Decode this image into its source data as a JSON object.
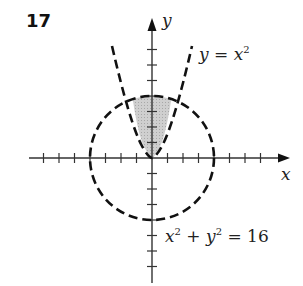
{
  "problem": {
    "number": "17"
  },
  "axes": {
    "x_label": "x",
    "y_label": "y",
    "x_ticks": [
      -7,
      -6,
      -5,
      -4,
      -3,
      -2,
      -1,
      1,
      2,
      3,
      4,
      5,
      6,
      7
    ],
    "y_ticks": [
      -7,
      -6,
      -5,
      -4,
      -3,
      -2,
      -1,
      1,
      2,
      3,
      4,
      5,
      6,
      7
    ]
  },
  "curves": {
    "parabola": {
      "lhs": "y",
      "eq": " = ",
      "base": "x",
      "exp": "2",
      "style": "dashed"
    },
    "circle": {
      "a": "x",
      "a_exp": "2",
      "plus": " + ",
      "b": "y",
      "b_exp": "2",
      "eq": " = ",
      "rhs": "16",
      "radius": 4,
      "style": "dashed"
    }
  },
  "shaded_region": {
    "description": "region above y = x^2 and inside x^2 + y^2 = 16",
    "color": "#c8c8c8"
  },
  "colors": {
    "stroke": "#111111",
    "shade": "#c8c8c8",
    "axis": "#333333"
  }
}
